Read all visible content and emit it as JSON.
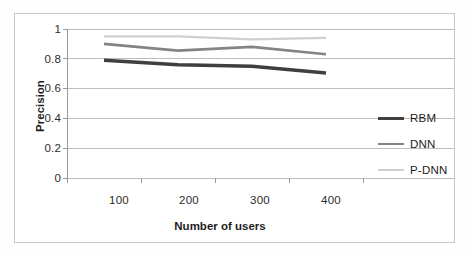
{
  "chart_data": {
    "type": "line",
    "title": "",
    "subtitle": "",
    "xlabel": "Number of users",
    "ylabel": "Precision",
    "categories": [
      "100",
      "200",
      "300",
      "400"
    ],
    "x": [
      100,
      200,
      300,
      400
    ],
    "xtick_labels": [
      "100",
      "200",
      "300",
      "400"
    ],
    "ytick_labels": [
      "0",
      "0.2",
      "0.4",
      "0.6",
      "0.8",
      "1"
    ],
    "ytick_values": [
      0,
      0.2,
      0.4,
      0.6,
      0.8,
      1
    ],
    "ylim": [
      0,
      1
    ],
    "grid": "horizontal",
    "legend_position": "right",
    "series": [
      {
        "name": "RBM",
        "values": [
          0.79,
          0.76,
          0.75,
          0.705
        ],
        "color": "#3f3f3f",
        "line_width": 3.4
      },
      {
        "name": "DNN",
        "values": [
          0.9,
          0.855,
          0.88,
          0.83
        ],
        "color": "#848484",
        "line_width": 2.6
      },
      {
        "name": "P-DNN",
        "values": [
          0.95,
          0.95,
          0.93,
          0.94
        ],
        "color": "#cfcfcf",
        "line_width": 2.2
      }
    ]
  },
  "axes": {
    "y_title": "Precision",
    "x_title": "Number of users",
    "y_ticks": [
      {
        "label": "1",
        "value": 1
      },
      {
        "label": "0.8",
        "value": 0.8
      },
      {
        "label": "0.6",
        "value": 0.6
      },
      {
        "label": "0.4",
        "value": 0.4
      },
      {
        "label": "0.2",
        "value": 0.2
      },
      {
        "label": "0",
        "value": 0
      }
    ],
    "x_ticks": [
      {
        "label": "100",
        "value": 100
      },
      {
        "label": "200",
        "value": 200
      },
      {
        "label": "300",
        "value": 300
      },
      {
        "label": "400",
        "value": 400
      }
    ]
  },
  "legend": {
    "items": [
      {
        "label": "RBM",
        "color": "#3f3f3f"
      },
      {
        "label": "DNN",
        "color": "#848484"
      },
      {
        "label": "P-DNN",
        "color": "#cfcfcf"
      }
    ]
  },
  "colors": {
    "frame_border": "#c9c9c9",
    "gridline": "#bdbdbd",
    "axis_line": "#9a9a9a",
    "tick_text": "#2b2b2b",
    "title_text": "#1d1d1d",
    "background": "#ffffff"
  }
}
